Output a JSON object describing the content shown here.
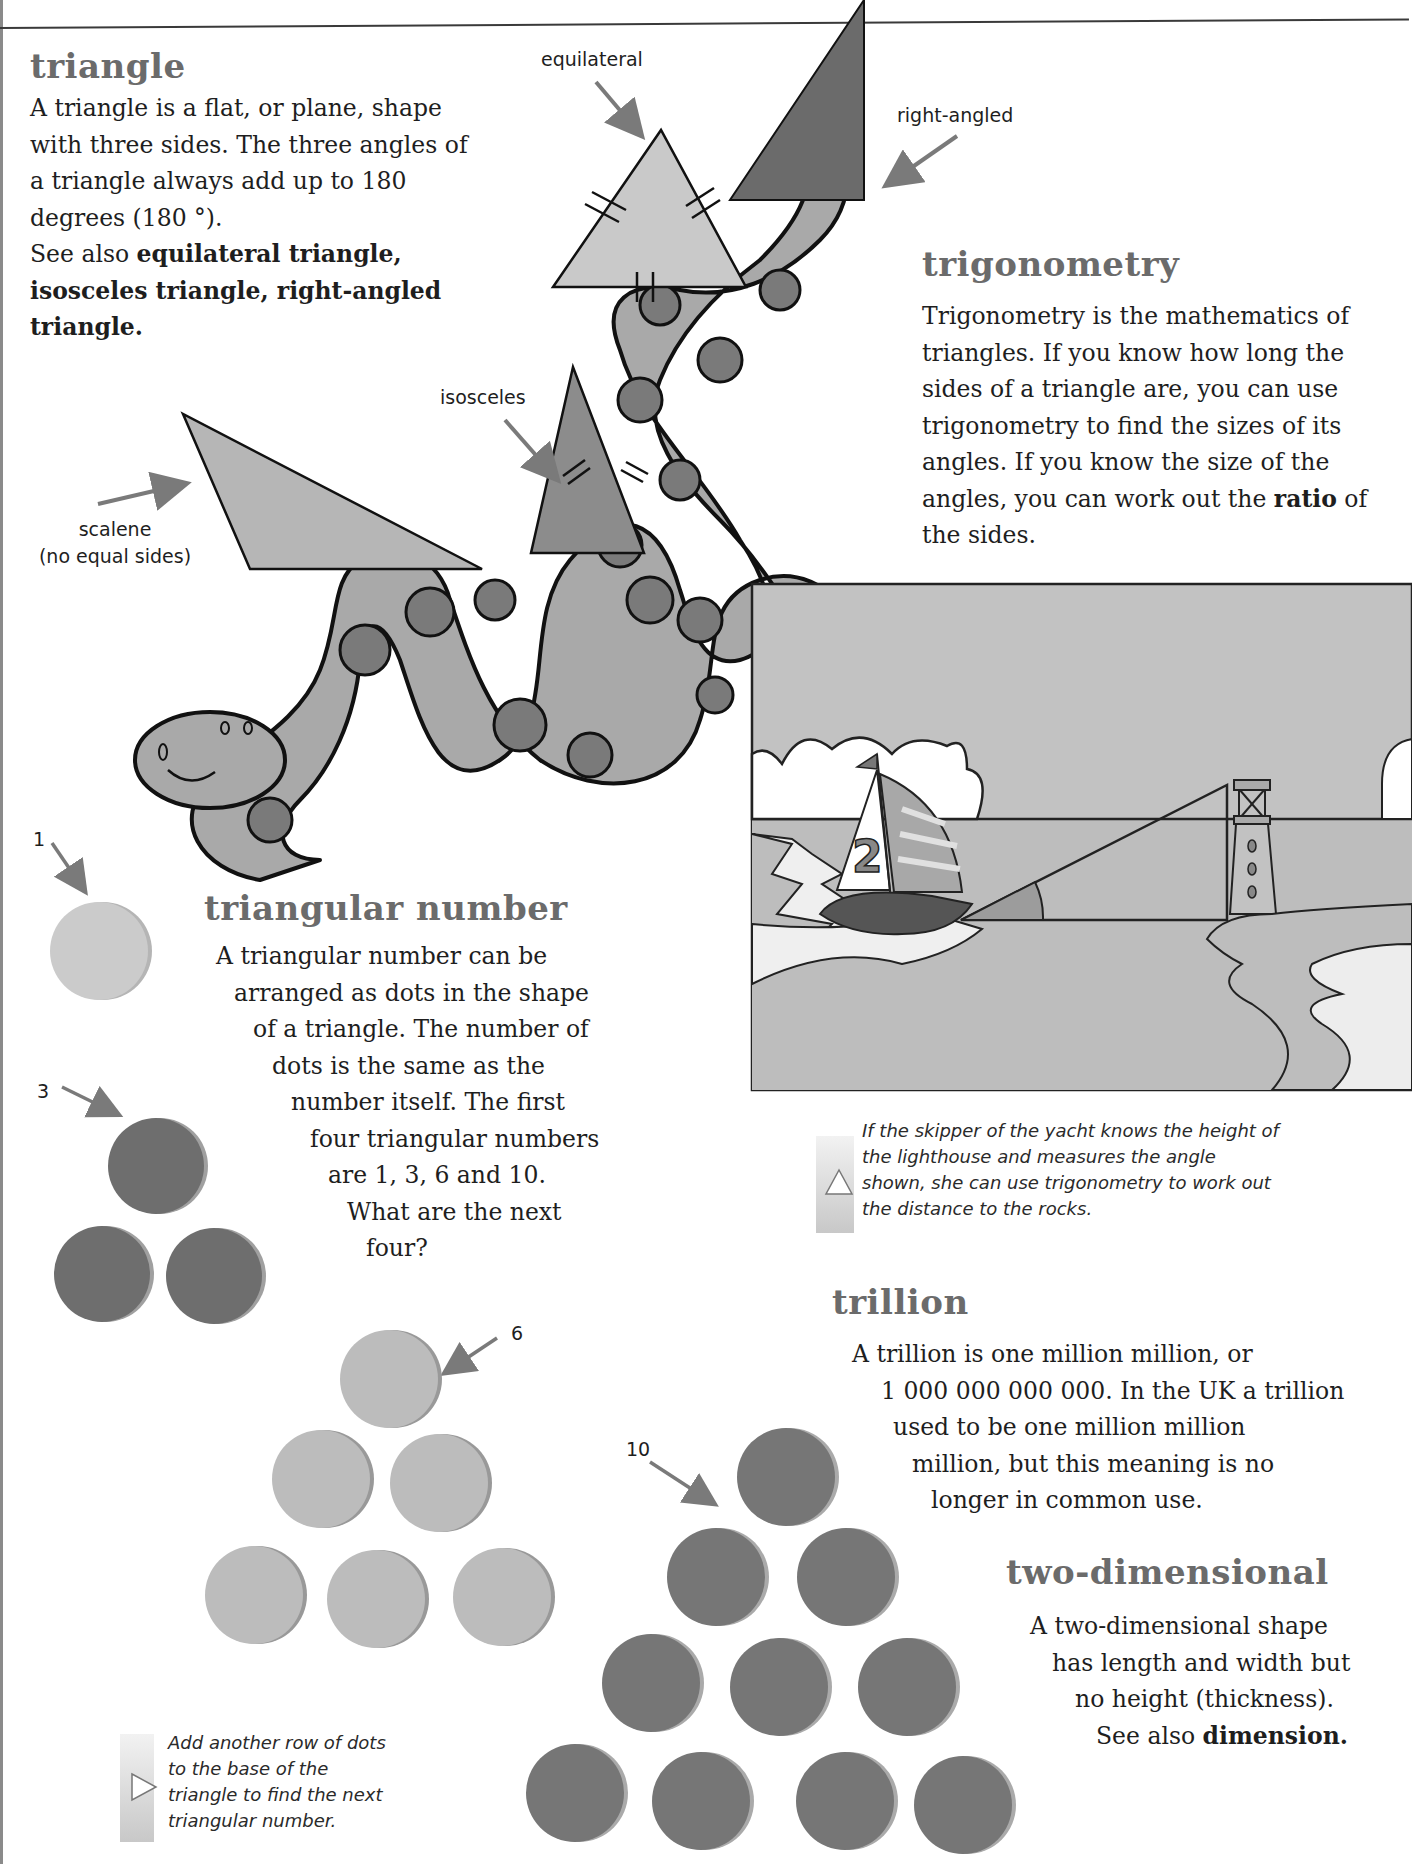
{
  "entries": {
    "triangle": {
      "heading": "triangle",
      "lines": [
        "A triangle is a flat, or plane, shape",
        "with three sides. The three angles of",
        "a triangle always add up to 180",
        "degrees (180 °)."
      ],
      "see_also_prefix": "See also ",
      "see_also_line1": "equilateral triangle,",
      "see_also_line2": "isosceles triangle, right-angled",
      "see_also_line3": "triangle."
    },
    "trigonometry": {
      "heading": "trigonometry",
      "lines": [
        "Trigonometry is the mathematics of",
        "triangles. If you know how long the",
        "sides of a triangle are, you can use",
        "trigonometry to find the sizes of its",
        "angles. If you know the size of the"
      ],
      "line6_prefix": "angles, you can work out the ",
      "line6_bold": "ratio",
      "line6_suffix": " of",
      "line7": "the sides."
    },
    "triangular_number": {
      "heading": "triangular number",
      "lines": [
        "A triangular number can be",
        "arranged as dots in the shape",
        "of a triangle. The number of",
        "dots is the same as the",
        "number itself. The first",
        "four triangular numbers",
        "are 1, 3, 6 and 10.",
        "What are the next",
        "four?"
      ]
    },
    "trillion": {
      "heading": "trillion",
      "lines": [
        "A trillion is one million million, or",
        "1 000 000 000 000. In the UK a trillion",
        "used to be one million million",
        "million, but this meaning is no",
        "longer in common use."
      ]
    },
    "two_dimensional": {
      "heading": "two-dimensional",
      "lines": [
        "A two-dimensional shape",
        "has length and width but",
        "no height (thickness)."
      ],
      "see_also_prefix": "See also ",
      "see_also_term": "dimension."
    }
  },
  "triangle_labels": {
    "equilateral": "equilateral",
    "right_angled": "right-angled",
    "isosceles": "isosceles",
    "scalene": "scalene",
    "scalene_note": "(no equal sides)"
  },
  "dot_labels": {
    "one": "1",
    "three": "3",
    "six": "6",
    "ten": "10"
  },
  "yacht_scene": {
    "sail_number": "2"
  },
  "captions": {
    "trigonometry_tip": [
      "If the skipper of the yacht knows the height of",
      "the lighthouse and measures the angle",
      "shown, she can use trigonometry to work out",
      "the distance to the rocks."
    ],
    "triangular_tip": [
      "Add another row of dots",
      "to the base of the",
      "triangle to find the next",
      "triangular number."
    ]
  },
  "colors": {
    "heading": "#6b6b6b",
    "light_fill": "#c9c9c9",
    "mid_fill": "#a9a9a9",
    "dark_fill": "#7a7a7a",
    "darkest_fill": "#666666",
    "sky": "#c2c2c2"
  }
}
